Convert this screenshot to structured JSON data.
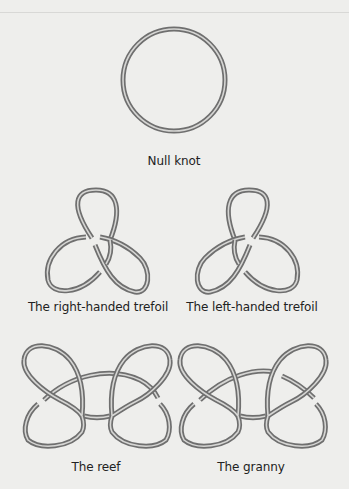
{
  "figure": {
    "knots": [
      {
        "id": "null",
        "label": "Null knot"
      },
      {
        "id": "right-trefoil",
        "label": "The right-handed trefoil"
      },
      {
        "id": "left-trefoil",
        "label": "The left-handed trefoil"
      },
      {
        "id": "reef",
        "label": "The reef"
      },
      {
        "id": "granny",
        "label": "The granny"
      }
    ],
    "colors": {
      "background": "#eeeeec",
      "tube": "#6f6f6f",
      "tube_highlight": "#d6d6d4",
      "text": "#222222"
    }
  }
}
